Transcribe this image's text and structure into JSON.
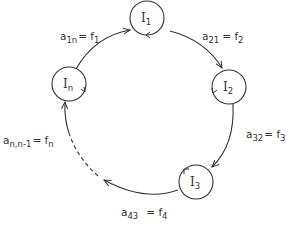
{
  "diagram": {
    "type": "cyclic-graph",
    "stroke_color": "#333333",
    "nodes": [
      {
        "id": "I1",
        "base": "I",
        "sub": "1",
        "cx": 147,
        "cy": 18,
        "r": 17
      },
      {
        "id": "I2",
        "base": "I",
        "sub": "2",
        "cx": 229,
        "cy": 87,
        "r": 17
      },
      {
        "id": "I3",
        "base": "I",
        "sub": "3",
        "cx": 196,
        "cy": 182,
        "r": 17
      },
      {
        "id": "In",
        "base": "I",
        "sub": "n",
        "cx": 69,
        "cy": 84,
        "r": 17
      }
    ],
    "edges": [
      {
        "from": "In",
        "to": "I1",
        "label_base": "a",
        "label_sub": "1n",
        "label_eq": "= f",
        "label_fsub": "1",
        "style": "solid"
      },
      {
        "from": "I1",
        "to": "I2",
        "label_base": "a",
        "label_sub": "21",
        "label_eq": "= f",
        "label_fsub": "2",
        "style": "solid"
      },
      {
        "from": "I2",
        "to": "I3",
        "label_base": "a",
        "label_sub": "32",
        "label_eq": "= f",
        "label_fsub": "3",
        "style": "solid"
      },
      {
        "from": "I3",
        "to": "...",
        "label_base": "a",
        "label_sub": "43",
        "label_eq": "= f",
        "label_fsub": "4",
        "style": "solid"
      },
      {
        "from": "...",
        "to": "In",
        "label_base": "a",
        "label_sub": "n,n-1",
        "label_eq": "= f",
        "label_fsub": "n",
        "style": "dashed"
      }
    ],
    "self_loops": "each node has a circular self-loop arrow"
  }
}
